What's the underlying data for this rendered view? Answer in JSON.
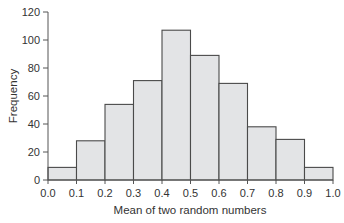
{
  "chart_data": {
    "type": "bar",
    "subtype": "histogram",
    "title": "",
    "xlabel": "Mean of two random numbers",
    "ylabel": "Frequency",
    "bin_edges": [
      0.0,
      0.1,
      0.2,
      0.3,
      0.4,
      0.5,
      0.6,
      0.7,
      0.8,
      0.9,
      1.0
    ],
    "categories": [
      "0.0-0.1",
      "0.1-0.2",
      "0.2-0.3",
      "0.3-0.4",
      "0.4-0.5",
      "0.5-0.6",
      "0.6-0.7",
      "0.7-0.8",
      "0.8-0.9",
      "0.9-1.0"
    ],
    "values": [
      9,
      28,
      54,
      71,
      107,
      89,
      69,
      38,
      29,
      9
    ],
    "xticks": [
      "0.0",
      "0.1",
      "0.2",
      "0.3",
      "0.4",
      "0.5",
      "0.6",
      "0.7",
      "0.8",
      "0.9",
      "1.0"
    ],
    "yticks": [
      "0",
      "20",
      "40",
      "60",
      "80",
      "100",
      "120"
    ],
    "xlim": [
      0,
      1.0
    ],
    "ylim": [
      0,
      120
    ],
    "grid": false,
    "legend": null,
    "colors": {
      "bar_fill": "#e3e4e6",
      "bar_stroke": "#4a4a4a",
      "axis": "#555555"
    }
  }
}
